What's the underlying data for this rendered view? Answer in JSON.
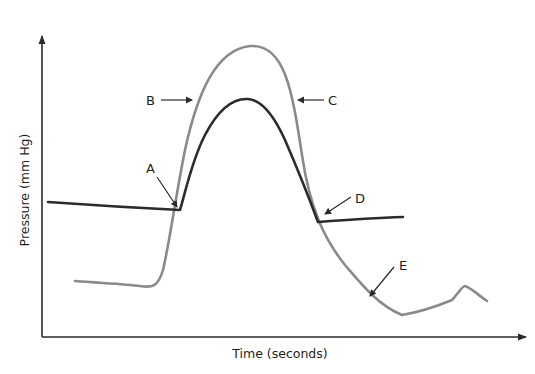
{
  "diagram": {
    "x_axis": {
      "label": "Time (seconds)"
    },
    "y_axis": {
      "label": "Pressure (mm Hg)"
    },
    "colors": {
      "axis": "#2a2a2a",
      "ventricular_curve": "#8a8a8a",
      "aortic_curve": "#2b2b2b",
      "pointer": "#2a2a2a"
    },
    "labels": {
      "A": "A",
      "B": "B",
      "C": "C",
      "D": "D",
      "E": "E"
    },
    "curves": [
      {
        "name": "gray curve (ventricular pressure)",
        "color": "gray"
      },
      {
        "name": "black curve (aortic pressure)",
        "color": "black"
      }
    ]
  }
}
